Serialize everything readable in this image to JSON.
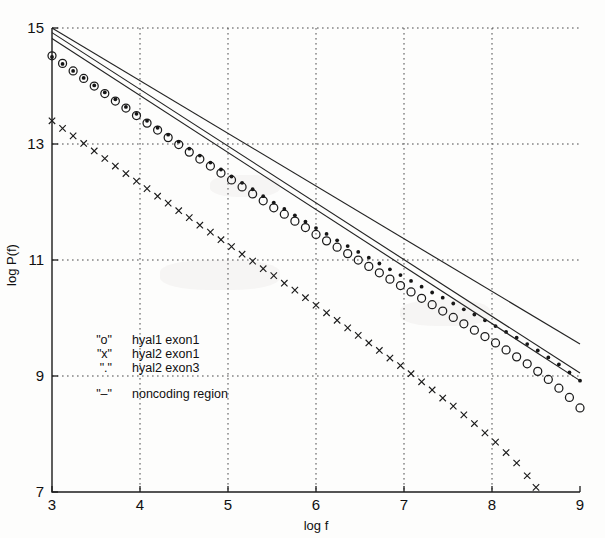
{
  "figure": {
    "background_color": "#fdfdfc",
    "ink_color": "#1b1b1b"
  },
  "axes": {
    "x_label": "log f",
    "y_label": "log P(f)",
    "x_ticks": [
      "3",
      "4",
      "5",
      "6",
      "7",
      "8",
      "9"
    ],
    "y_ticks": [
      "7",
      "9",
      "11",
      "13",
      "15"
    ],
    "x_tick_values": [
      3,
      4,
      5,
      6,
      7,
      8,
      9
    ],
    "y_tick_values": [
      7,
      9,
      11,
      13,
      15
    ]
  },
  "legend": {
    "entries": [
      {
        "symbol": "\"o\"",
        "label": "hyal1 exon1"
      },
      {
        "symbol": "\"x\"",
        "label": "hyal2 exon1"
      },
      {
        "symbol": "\".\"",
        "label": "hyal2 exon3"
      },
      {
        "symbol": "\"–\"",
        "label": "noncoding region"
      }
    ]
  },
  "chart_data": {
    "type": "scatter",
    "title": "",
    "xlabel": "log f",
    "ylabel": "log P(f)",
    "xlim": [
      3,
      9
    ],
    "ylim": [
      7,
      15
    ],
    "grid": true,
    "legend_position": "inner-left",
    "series": [
      {
        "name": "hyal1 exon1",
        "marker": "o",
        "style": "circle-open",
        "x": [
          3.0,
          3.12,
          3.24,
          3.36,
          3.48,
          3.6,
          3.72,
          3.84,
          3.96,
          4.08,
          4.2,
          4.32,
          4.44,
          4.56,
          4.68,
          4.8,
          4.92,
          5.04,
          5.16,
          5.28,
          5.4,
          5.52,
          5.64,
          5.76,
          5.88,
          6.0,
          6.12,
          6.24,
          6.36,
          6.48,
          6.6,
          6.72,
          6.84,
          6.96,
          7.08,
          7.2,
          7.32,
          7.44,
          7.56,
          7.68,
          7.8,
          7.92,
          8.04,
          8.16,
          8.28,
          8.4,
          8.52,
          8.64,
          8.76,
          8.88,
          9.0
        ],
        "y": [
          14.52,
          14.39,
          14.26,
          14.13,
          14.0,
          13.87,
          13.74,
          13.62,
          13.49,
          13.36,
          13.24,
          13.11,
          12.99,
          12.86,
          12.74,
          12.62,
          12.5,
          12.38,
          12.26,
          12.14,
          12.02,
          11.9,
          11.79,
          11.67,
          11.56,
          11.44,
          11.33,
          11.22,
          11.11,
          11.0,
          10.89,
          10.78,
          10.67,
          10.56,
          10.45,
          10.34,
          10.23,
          10.12,
          10.01,
          9.9,
          9.79,
          9.68,
          9.57,
          9.45,
          9.33,
          9.21,
          9.08,
          8.94,
          8.79,
          8.63,
          8.45
        ]
      },
      {
        "name": "hyal2 exon3",
        "marker": ".",
        "style": "dot-filled",
        "x": [
          3.0,
          3.12,
          3.24,
          3.36,
          3.48,
          3.6,
          3.72,
          3.84,
          3.96,
          4.08,
          4.2,
          4.32,
          4.44,
          4.56,
          4.68,
          4.8,
          4.92,
          5.04,
          5.16,
          5.28,
          5.4,
          5.52,
          5.64,
          5.76,
          5.88,
          6.0,
          6.12,
          6.24,
          6.36,
          6.48,
          6.6,
          6.72,
          6.84,
          6.96,
          7.08,
          7.2,
          7.32,
          7.44,
          7.56,
          7.68,
          7.8,
          7.92,
          8.04,
          8.16,
          8.28,
          8.4,
          8.52,
          8.64,
          8.76,
          8.88,
          9.0
        ],
        "y": [
          14.5,
          14.38,
          14.26,
          14.14,
          14.01,
          13.89,
          13.77,
          13.64,
          13.52,
          13.4,
          13.28,
          13.16,
          13.04,
          12.92,
          12.8,
          12.68,
          12.56,
          12.44,
          12.33,
          12.22,
          12.1,
          11.99,
          11.88,
          11.77,
          11.66,
          11.55,
          11.45,
          11.34,
          11.24,
          11.14,
          11.04,
          10.94,
          10.84,
          10.74,
          10.64,
          10.54,
          10.44,
          10.35,
          10.25,
          10.15,
          10.06,
          9.96,
          9.86,
          9.76,
          9.66,
          9.55,
          9.44,
          9.32,
          9.2,
          9.06,
          8.92
        ]
      },
      {
        "name": "hyal2 exon1",
        "marker": "x",
        "style": "cross",
        "x": [
          3.0,
          3.12,
          3.24,
          3.36,
          3.48,
          3.6,
          3.72,
          3.84,
          3.96,
          4.08,
          4.2,
          4.32,
          4.44,
          4.56,
          4.68,
          4.8,
          4.92,
          5.04,
          5.16,
          5.28,
          5.4,
          5.52,
          5.64,
          5.76,
          5.88,
          6.0,
          6.12,
          6.24,
          6.36,
          6.48,
          6.6,
          6.72,
          6.84,
          6.96,
          7.08,
          7.2,
          7.32,
          7.44,
          7.56,
          7.68,
          7.8,
          7.92,
          8.04,
          8.16,
          8.28,
          8.4,
          8.5
        ],
        "y": [
          13.4,
          13.27,
          13.14,
          13.01,
          12.88,
          12.75,
          12.62,
          12.49,
          12.36,
          12.23,
          12.1,
          11.98,
          11.85,
          11.73,
          11.6,
          11.48,
          11.35,
          11.23,
          11.1,
          10.98,
          10.85,
          10.73,
          10.6,
          10.48,
          10.35,
          10.22,
          10.09,
          9.96,
          9.83,
          9.7,
          9.57,
          9.44,
          9.31,
          9.18,
          9.04,
          8.9,
          8.76,
          8.62,
          8.48,
          8.33,
          8.18,
          8.02,
          7.86,
          7.68,
          7.5,
          7.28,
          7.08
        ]
      }
    ],
    "reference_lines": [
      {
        "name": "noncoding region A",
        "marker": "-",
        "style": "solid",
        "x": [
          3.0,
          9.0
        ],
        "y": [
          15.0,
          9.55
        ]
      },
      {
        "name": "noncoding region B",
        "marker": "-",
        "style": "solid",
        "x": [
          3.0,
          9.0
        ],
        "y": [
          14.92,
          9.05
        ]
      },
      {
        "name": "noncoding region C",
        "marker": "-",
        "style": "solid",
        "x": [
          3.0,
          9.0
        ],
        "y": [
          14.82,
          8.92
        ]
      }
    ]
  }
}
